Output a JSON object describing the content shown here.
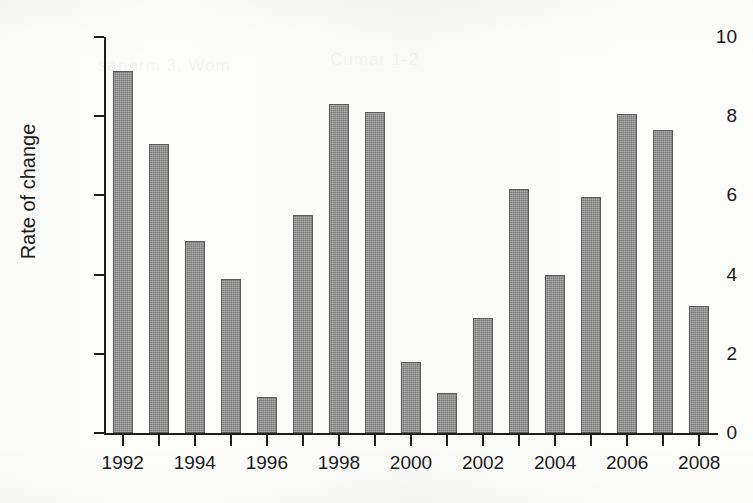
{
  "chart_data": {
    "type": "bar",
    "title": "",
    "xlabel": "",
    "ylabel": "Rate of change",
    "ylim": [
      0,
      10
    ],
    "xlim": [
      1991.5,
      2008.5
    ],
    "grid": false,
    "legend": null,
    "y_ticks": [
      0,
      2,
      4,
      6,
      8,
      10
    ],
    "y_tick_labels": [
      "0",
      "2",
      "4",
      "6",
      "8",
      "10"
    ],
    "x_ticks": [
      1992,
      1993,
      1994,
      1995,
      1996,
      1997,
      1998,
      1999,
      2000,
      2001,
      2002,
      2003,
      2004,
      2005,
      2006,
      2007,
      2008
    ],
    "x_tick_labels": [
      "1992",
      "",
      "1994",
      "",
      "1996",
      "",
      "1998",
      "",
      "2000",
      "",
      "2002",
      "",
      "2004",
      "",
      "2006",
      "",
      "2008"
    ],
    "categories": [
      "1992",
      "1993",
      "1994",
      "1995",
      "1996",
      "1997",
      "1998",
      "1999",
      "2000",
      "2001",
      "2002",
      "2003",
      "2004",
      "2005",
      "2006",
      "2007",
      "2008"
    ],
    "values": [
      9.15,
      7.3,
      4.85,
      3.9,
      0.9,
      5.5,
      8.3,
      8.1,
      1.8,
      1.0,
      2.9,
      6.15,
      4.0,
      5.95,
      8.05,
      7.65,
      3.2
    ],
    "bar_color": "#8a8a8a",
    "bar_edge_color": "#5d5d5d",
    "axis_color": "#1d1d1d",
    "background_color": "#fdfdfc"
  },
  "figure": {
    "ghost_text": [
      "sanarm 3. Wom",
      "Cumar 1-2",
      "",
      ""
    ]
  }
}
